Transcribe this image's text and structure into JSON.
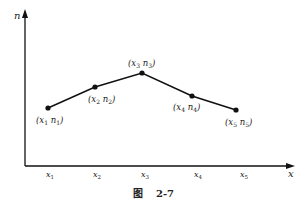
{
  "figure": {
    "caption_prefix": "图",
    "caption_number": "2-7",
    "y_axis_label": "n",
    "x_axis_label": "x",
    "x_ticks": [
      "x1",
      "x2",
      "x3",
      "x4",
      "x5"
    ],
    "points": [
      {
        "label": "(x1 n1)",
        "x_sub": "1",
        "n_sub": "1"
      },
      {
        "label": "(x2 n2)",
        "x_sub": "2",
        "n_sub": "2"
      },
      {
        "label": "(x3 n3)",
        "x_sub": "3",
        "n_sub": "3"
      },
      {
        "label": "(x4 n4)",
        "x_sub": "4",
        "n_sub": "4"
      },
      {
        "label": "(x5 n5)",
        "x_sub": "5",
        "n_sub": "5"
      }
    ],
    "line_color": "#111111"
  }
}
